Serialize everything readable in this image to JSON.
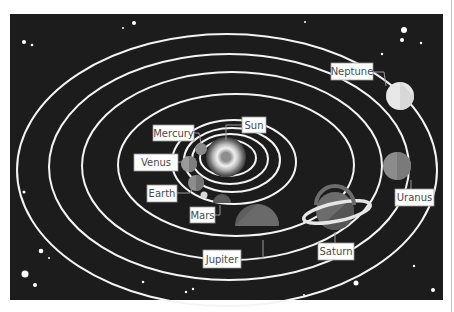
{
  "diagram": {
    "colors": {
      "background": "#ffffff",
      "space": "#1c1c1c",
      "orbit": "#f4f4f4",
      "label_bg": "#ffffff",
      "label_border": "#9a9a9a",
      "label_text": "#4a4a4a",
      "leader": "#9a9a9a"
    },
    "labels": {
      "sun": "Sun",
      "mercury": "Mercury",
      "venus": "Venus",
      "earth": "Earth",
      "mars": "Mars",
      "jupiter": "Jupiter",
      "saturn": "Saturn",
      "uranus": "Uranus",
      "neptune": "Neptune"
    }
  }
}
